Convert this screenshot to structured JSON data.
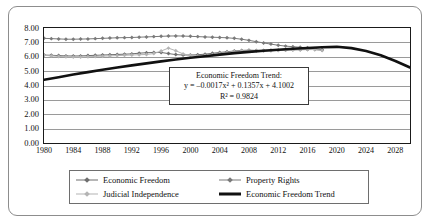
{
  "chart_data": {
    "type": "line",
    "title": "",
    "xlabel": "",
    "ylabel": "",
    "xlim": [
      1980,
      2030
    ],
    "ylim": [
      0.0,
      8.0
    ],
    "grid": true,
    "legend_position": "bottom",
    "ytick_labels": [
      "8.00",
      "7.00",
      "6.00",
      "5.00",
      "4.00",
      "3.00",
      "2.00",
      "1.00",
      "0.00"
    ],
    "ytick_values": [
      8,
      7,
      6,
      5,
      4,
      3,
      2,
      1,
      0
    ],
    "xtick_labels": [
      "1980",
      "1984",
      "1988",
      "1992",
      "1996",
      "2000",
      "2004",
      "2008",
      "2012",
      "2016",
      "2020",
      "2024",
      "2028"
    ],
    "xtick_values": [
      1980,
      1984,
      1988,
      1992,
      1996,
      2000,
      2004,
      2008,
      2012,
      2016,
      2020,
      2024,
      2028
    ],
    "annotations": {
      "trend_box": {
        "title": "Economic Freedom Trend:",
        "equation": "y = –0.0017x² + 0.1357x + 4.1002",
        "r_squared": "R² = 0.9824"
      }
    },
    "series": [
      {
        "name": "Economic Freedom",
        "color": "#6f6f6f",
        "marker": "diamond",
        "x": [
          1980,
          1981,
          1982,
          1983,
          1984,
          1985,
          1986,
          1987,
          1988,
          1989,
          1990,
          1991,
          1992,
          1993,
          1994,
          1995,
          1996,
          1997,
          1998,
          1999,
          2000,
          2001,
          2002,
          2003,
          2004,
          2005,
          2006,
          2007,
          2008,
          2009,
          2010,
          2011,
          2012,
          2013,
          2014,
          2015,
          2016,
          2017,
          2018
        ],
        "values": [
          6.12,
          6.1,
          6.08,
          6.06,
          6.05,
          6.06,
          6.08,
          6.1,
          6.12,
          6.14,
          6.16,
          6.18,
          6.2,
          6.25,
          6.28,
          6.3,
          6.3,
          6.22,
          6.15,
          6.12,
          6.12,
          6.14,
          6.18,
          6.24,
          6.3,
          6.35,
          6.4,
          6.44,
          6.46,
          6.44,
          6.44,
          6.45,
          6.46,
          6.47,
          6.48,
          6.49,
          6.5,
          6.5,
          6.46
        ]
      },
      {
        "name": "Property Rights",
        "color": "#7a7a7a",
        "marker": "diamond",
        "x": [
          1980,
          1981,
          1982,
          1983,
          1984,
          1985,
          1986,
          1987,
          1988,
          1989,
          1990,
          1991,
          1992,
          1993,
          1994,
          1995,
          1996,
          1997,
          1998,
          1999,
          2000,
          2001,
          2002,
          2003,
          2004,
          2005,
          2006,
          2007,
          2008,
          2009,
          2010,
          2011,
          2012,
          2013,
          2014,
          2015,
          2016,
          2017,
          2018
        ],
        "values": [
          7.28,
          7.26,
          7.24,
          7.22,
          7.22,
          7.23,
          7.24,
          7.26,
          7.28,
          7.3,
          7.32,
          7.33,
          7.34,
          7.36,
          7.38,
          7.4,
          7.42,
          7.44,
          7.45,
          7.44,
          7.42,
          7.4,
          7.38,
          7.36,
          7.34,
          7.32,
          7.28,
          7.22,
          7.14,
          7.05,
          6.96,
          6.88,
          6.8,
          6.74,
          6.7,
          6.66,
          6.62,
          6.56,
          6.48
        ]
      },
      {
        "name": "Judicial Independence",
        "color": "#b4b4b4",
        "marker": "diamond",
        "x": [
          1980,
          1981,
          1982,
          1983,
          1984,
          1985,
          1986,
          1987,
          1988,
          1989,
          1990,
          1991,
          1992,
          1993,
          1994,
          1995,
          1996,
          1997,
          1998,
          1999,
          2000,
          2001,
          2002,
          2003,
          2004,
          2005,
          2006,
          2007,
          2008,
          2009,
          2010,
          2011,
          2012,
          2013,
          2014,
          2015,
          2016,
          2017,
          2018
        ],
        "values": [
          6.1,
          6.06,
          6.02,
          6.0,
          5.98,
          5.98,
          6.0,
          6.02,
          6.04,
          6.06,
          6.08,
          6.1,
          6.12,
          6.14,
          6.16,
          6.22,
          6.4,
          6.6,
          6.42,
          6.2,
          6.1,
          6.06,
          6.08,
          6.14,
          6.22,
          6.3,
          6.36,
          6.4,
          6.42,
          6.4,
          6.4,
          6.42,
          6.44,
          6.46,
          6.48,
          6.5,
          6.52,
          6.5,
          6.44
        ]
      },
      {
        "name": "Economic Freedom Trend",
        "color": "#111111",
        "marker": "none",
        "trend": true,
        "x": [
          1980,
          1982,
          1984,
          1986,
          1988,
          1990,
          1992,
          1994,
          1996,
          1998,
          2000,
          2002,
          2004,
          2006,
          2008,
          2010,
          2012,
          2014,
          2016,
          2018,
          2020,
          2022,
          2024,
          2026,
          2028,
          2030
        ],
        "values": [
          4.4,
          4.58,
          4.76,
          4.93,
          5.09,
          5.25,
          5.4,
          5.54,
          5.68,
          5.81,
          5.93,
          6.04,
          6.15,
          6.25,
          6.34,
          6.42,
          6.49,
          6.56,
          6.61,
          6.66,
          6.69,
          6.6,
          6.4,
          6.1,
          5.7,
          5.25
        ]
      }
    ]
  },
  "legend": {
    "items": [
      {
        "label": "Economic Freedom",
        "color": "#6f6f6f",
        "marker": "diamond",
        "thick": false
      },
      {
        "label": "Property Rights",
        "color": "#7a7a7a",
        "marker": "diamond",
        "thick": false
      },
      {
        "label": "Judicial Independence",
        "color": "#b4b4b4",
        "marker": "diamond",
        "thick": false
      },
      {
        "label": "Economic Freedom Trend",
        "color": "#111111",
        "marker": "none",
        "thick": true
      }
    ]
  },
  "colors": {
    "frame": "#8d8d8d",
    "plot_border": "#1a1a1a",
    "gridline": "#9a9a9a",
    "background": "#ffffff",
    "text": "#111111"
  }
}
